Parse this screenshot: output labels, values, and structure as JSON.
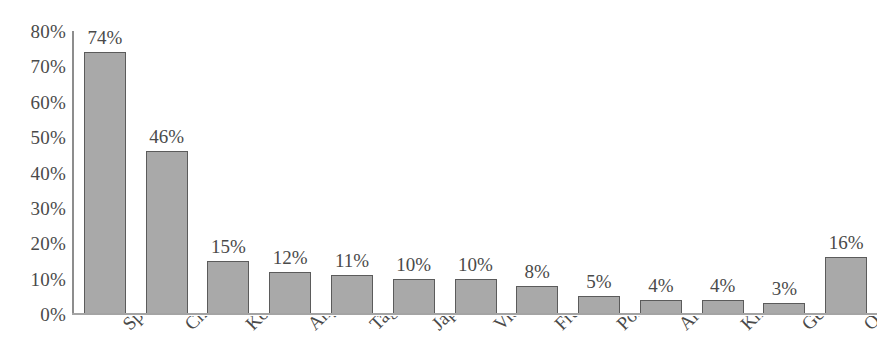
{
  "chart_data": {
    "type": "bar",
    "title": "",
    "subtitle": "",
    "xlabel": "",
    "ylabel": "",
    "ylim": [
      0,
      80
    ],
    "grid": false,
    "legend": null,
    "orientation": "vertical",
    "value_suffix": "%",
    "categories": [
      "Spanish",
      "Chinese",
      "Korean",
      "Any",
      "Tagalog",
      "Japanese",
      "Vietnamese",
      "French",
      "Portuguese",
      "Arabic",
      "Khmer",
      "German",
      "Other"
    ],
    "category_labels_visible": [
      "nish",
      "nese",
      "rean",
      "Any",
      "alog",
      "nese",
      "nese",
      "nch",
      "uese",
      "abic",
      "hmer",
      "man",
      "Other"
    ],
    "values": [
      74,
      46,
      15,
      12,
      11,
      10,
      10,
      8,
      5,
      4,
      4,
      3,
      16
    ],
    "value_labels": [
      "74%",
      "46%",
      "15%",
      "12%",
      "11%",
      "10%",
      "10%",
      "8%",
      "5%",
      "4%",
      "4%",
      "3%",
      "16%"
    ],
    "y_ticks": [
      80,
      70,
      60,
      50,
      40,
      30,
      20,
      10,
      0
    ],
    "y_tick_labels": [
      "80%",
      "70%",
      "60%",
      "50%",
      "40%",
      "30%",
      "20%",
      "10%",
      "0%"
    ],
    "colors": {
      "bar_fill": "#a9a9a9",
      "bar_stroke": "#5b5b5b",
      "axis": "#8d8d8d",
      "baseline": "#a4a4a4",
      "text": "#4a4a4a",
      "background": "#ffffff"
    }
  }
}
